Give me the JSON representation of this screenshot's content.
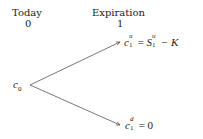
{
  "header": {
    "today_label": "Today",
    "today_time": "0",
    "expiration_label": "Expiration",
    "expiration_time": "1"
  },
  "nodes": {
    "root": {
      "base": "c",
      "sub": "0"
    },
    "up": {
      "base": "c",
      "sup": "u",
      "sub": "1",
      "rhs_base": "S",
      "rhs_sup": "u",
      "rhs_sub": "1",
      "rhs_tail": "− K",
      "eq": "="
    },
    "down": {
      "base": "c",
      "sup": "d",
      "sub": "1",
      "eq": "=",
      "value": "0"
    }
  },
  "colors": {
    "line": "#555555",
    "text": "#222222"
  }
}
